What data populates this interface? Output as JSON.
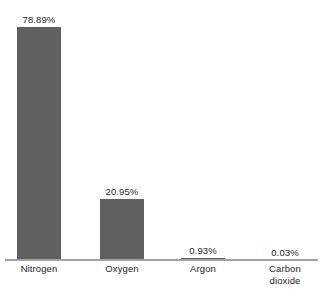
{
  "chart_data": {
    "type": "bar",
    "title": "",
    "subtitle": "",
    "xlabel": "",
    "ylabel": "",
    "categories": [
      "Nitrogen",
      "Oxygen",
      "Argon",
      "Carbon dioxide"
    ],
    "values": [
      78.89,
      20.95,
      0.93,
      0.03
    ],
    "value_labels": [
      "78.89%",
      "20.95%",
      "0.93%",
      "0.03%"
    ],
    "ylim": [
      0,
      78.89
    ],
    "grid": false,
    "legend": false,
    "legend_position": "none",
    "orientation": "vertical",
    "bars": [
      {
        "category": "Nitrogen",
        "value": 78.89,
        "label": "78.89%",
        "lines": [
          "Nitrogen"
        ]
      },
      {
        "category": "Oxygen",
        "value": 20.95,
        "label": "20.95%",
        "lines": [
          "Oxygen"
        ]
      },
      {
        "category": "Argon",
        "value": 0.93,
        "label": "0.93%",
        "lines": [
          "Argon"
        ]
      },
      {
        "category": "Carbon dioxide",
        "value": 0.03,
        "label": "0.03%",
        "lines": [
          "Carbon",
          "dioxide"
        ]
      }
    ]
  },
  "style": {
    "bar_color": "#606060",
    "axis_color": "#a2a2a2",
    "text_color": "#262626",
    "background": "#ffffff"
  }
}
